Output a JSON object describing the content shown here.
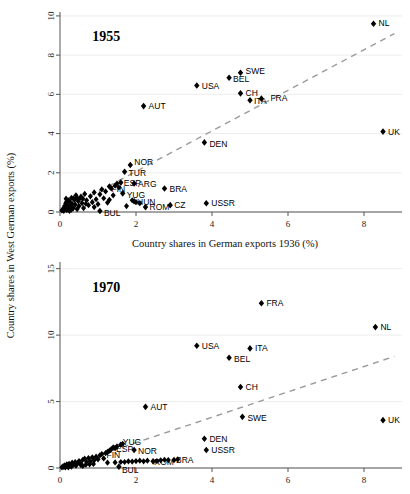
{
  "figure": {
    "xlabel": "Country shares in German exports 1936 (%)",
    "ylabel": "Country shares in West German exports (%)",
    "marker_color": "#000000",
    "refline_color": "#9a9a9a",
    "grid_color": "#e9e9e9"
  },
  "chart_data": [
    {
      "type": "scatter",
      "title": "1955",
      "xlabel": "Country shares in German exports 1936 (%)",
      "ylabel": "Country shares in West German exports (%)",
      "xlim": [
        0,
        9.0
      ],
      "ylim": [
        0,
        10.2
      ],
      "xticks": [
        0,
        2,
        4,
        6,
        8
      ],
      "yticks": [
        0,
        2,
        4,
        6,
        8,
        10
      ],
      "grid": true,
      "legend": "none",
      "annotations": [
        "1955"
      ],
      "reference_line": {
        "style": "dashed",
        "x": [
          0.0,
          8.8
        ],
        "y": [
          0.0,
          9.1
        ],
        "label": "45-degree / fitted line"
      },
      "labeled_points": [
        {
          "label": "NL",
          "x": 8.25,
          "y": 9.6
        },
        {
          "label": "SWE",
          "x": 4.75,
          "y": 7.1
        },
        {
          "label": "BEL",
          "x": 4.45,
          "y": 6.85
        },
        {
          "label": "USA",
          "x": 3.6,
          "y": 6.45
        },
        {
          "label": "CH",
          "x": 4.75,
          "y": 6.05
        },
        {
          "label": "ITA",
          "x": 5.0,
          "y": 5.7
        },
        {
          "label": "FRA",
          "x": 5.3,
          "y": 5.78
        },
        {
          "label": "AUT",
          "x": 2.2,
          "y": 5.4
        },
        {
          "label": "UK",
          "x": 8.5,
          "y": 4.1
        },
        {
          "label": "DEN",
          "x": 3.8,
          "y": 3.55
        },
        {
          "label": "NOR",
          "x": 1.85,
          "y": 2.4
        },
        {
          "label": "TUR",
          "x": 1.7,
          "y": 2.05
        },
        {
          "label": "ESP",
          "x": 1.6,
          "y": 1.5
        },
        {
          "label": "ARG",
          "x": 1.95,
          "y": 1.45
        },
        {
          "label": "FIN",
          "x": 1.3,
          "y": 1.3
        },
        {
          "label": "BRA",
          "x": 2.75,
          "y": 1.2
        },
        {
          "label": "YUG",
          "x": 1.65,
          "y": 0.95
        },
        {
          "label": "HUN",
          "x": 1.95,
          "y": 0.55
        },
        {
          "label": "ROM",
          "x": 2.25,
          "y": 0.25
        },
        {
          "label": "CZ",
          "x": 2.9,
          "y": 0.35
        },
        {
          "label": "USSR",
          "x": 3.85,
          "y": 0.45
        },
        {
          "label": "BUL",
          "x": 1.05,
          "y": 0.05
        }
      ],
      "unlabeled_points": [
        {
          "x": 0.05,
          "y": 0.08
        },
        {
          "x": 0.08,
          "y": 0.15
        },
        {
          "x": 0.1,
          "y": 0.05
        },
        {
          "x": 0.12,
          "y": 0.3
        },
        {
          "x": 0.14,
          "y": 0.22
        },
        {
          "x": 0.15,
          "y": 0.45
        },
        {
          "x": 0.18,
          "y": 0.1
        },
        {
          "x": 0.2,
          "y": 0.35
        },
        {
          "x": 0.22,
          "y": 0.6
        },
        {
          "x": 0.24,
          "y": 0.18
        },
        {
          "x": 0.26,
          "y": 0.5
        },
        {
          "x": 0.28,
          "y": 0.28
        },
        {
          "x": 0.3,
          "y": 0.72
        },
        {
          "x": 0.32,
          "y": 0.42
        },
        {
          "x": 0.35,
          "y": 0.2
        },
        {
          "x": 0.38,
          "y": 0.62
        },
        {
          "x": 0.4,
          "y": 0.38
        },
        {
          "x": 0.42,
          "y": 0.85
        },
        {
          "x": 0.45,
          "y": 0.15
        },
        {
          "x": 0.48,
          "y": 0.55
        },
        {
          "x": 0.5,
          "y": 0.3
        },
        {
          "x": 0.55,
          "y": 0.78
        },
        {
          "x": 0.58,
          "y": 0.45
        },
        {
          "x": 0.62,
          "y": 0.2
        },
        {
          "x": 0.65,
          "y": 0.92
        },
        {
          "x": 0.7,
          "y": 0.6
        },
        {
          "x": 0.75,
          "y": 0.35
        },
        {
          "x": 0.8,
          "y": 0.8
        },
        {
          "x": 0.85,
          "y": 0.5
        },
        {
          "x": 0.9,
          "y": 1.0
        },
        {
          "x": 0.95,
          "y": 0.65
        },
        {
          "x": 1.0,
          "y": 0.4
        },
        {
          "x": 1.05,
          "y": 0.9
        },
        {
          "x": 1.1,
          "y": 1.15
        },
        {
          "x": 1.15,
          "y": 0.7
        },
        {
          "x": 1.2,
          "y": 1.05
        },
        {
          "x": 1.25,
          "y": 0.48
        },
        {
          "x": 1.35,
          "y": 1.2
        },
        {
          "x": 1.4,
          "y": 0.85
        },
        {
          "x": 1.45,
          "y": 1.35
        },
        {
          "x": 1.5,
          "y": 1.45
        },
        {
          "x": 1.55,
          "y": 1.25
        },
        {
          "x": 0.6,
          "y": 0.68
        },
        {
          "x": 0.35,
          "y": 0.7
        },
        {
          "x": 0.45,
          "y": 0.72
        },
        {
          "x": 0.18,
          "y": 0.55
        },
        {
          "x": 0.9,
          "y": 0.25
        },
        {
          "x": 1.3,
          "y": 0.62
        },
        {
          "x": 1.75,
          "y": 0.3
        },
        {
          "x": 0.68,
          "y": 0.42
        },
        {
          "x": 0.25,
          "y": 0.05
        },
        {
          "x": 0.16,
          "y": 0.68
        },
        {
          "x": 0.3,
          "y": 0.12
        },
        {
          "x": 0.5,
          "y": 0.65
        },
        {
          "x": 2.0,
          "y": 0.5
        },
        {
          "x": 2.1,
          "y": 0.45
        },
        {
          "x": 1.9,
          "y": 0.6
        }
      ]
    },
    {
      "type": "scatter",
      "title": "1970",
      "xlabel": "Country shares in German exports 1936 (%)",
      "ylabel": "Country shares in West German exports (%)",
      "xlim": [
        0,
        9.0
      ],
      "ylim": [
        0,
        15.5
      ],
      "xticks": [
        0,
        2,
        4,
        6,
        8
      ],
      "yticks": [
        0,
        5,
        10,
        15
      ],
      "grid": true,
      "legend": "none",
      "annotations": [
        "1970"
      ],
      "reference_line": {
        "style": "dashed",
        "x": [
          0.0,
          8.8
        ],
        "y": [
          0.0,
          8.4
        ],
        "label": "45-degree / fitted line"
      },
      "labeled_points": [
        {
          "label": "FRA",
          "x": 5.3,
          "y": 12.4
        },
        {
          "label": "NL",
          "x": 8.3,
          "y": 10.6
        },
        {
          "label": "USA",
          "x": 3.6,
          "y": 9.2
        },
        {
          "label": "ITA",
          "x": 5.0,
          "y": 9.0
        },
        {
          "label": "BEL",
          "x": 4.45,
          "y": 8.3
        },
        {
          "label": "CH",
          "x": 4.75,
          "y": 6.1
        },
        {
          "label": "AUT",
          "x": 2.25,
          "y": 4.6
        },
        {
          "label": "SWE",
          "x": 4.8,
          "y": 3.85
        },
        {
          "label": "UK",
          "x": 8.5,
          "y": 3.6
        },
        {
          "label": "DEN",
          "x": 3.8,
          "y": 2.2
        },
        {
          "label": "USSR",
          "x": 3.85,
          "y": 1.35
        },
        {
          "label": "YUG",
          "x": 1.6,
          "y": 1.75
        },
        {
          "label": "NOR",
          "x": 1.95,
          "y": 1.35
        },
        {
          "label": "ESP",
          "x": 1.45,
          "y": 1.5
        },
        {
          "label": "FIN",
          "x": 1.25,
          "y": 1.2
        },
        {
          "label": "ROM",
          "x": 2.45,
          "y": 0.5
        },
        {
          "label": "BRA",
          "x": 3.0,
          "y": 0.6
        },
        {
          "label": "BUL",
          "x": 1.55,
          "y": 0.1
        }
      ],
      "unlabeled_points": [
        {
          "x": 0.05,
          "y": 0.05
        },
        {
          "x": 0.08,
          "y": 0.12
        },
        {
          "x": 0.1,
          "y": 0.08
        },
        {
          "x": 0.12,
          "y": 0.2
        },
        {
          "x": 0.15,
          "y": 0.1
        },
        {
          "x": 0.18,
          "y": 0.28
        },
        {
          "x": 0.2,
          "y": 0.15
        },
        {
          "x": 0.24,
          "y": 0.32
        },
        {
          "x": 0.28,
          "y": 0.2
        },
        {
          "x": 0.32,
          "y": 0.4
        },
        {
          "x": 0.36,
          "y": 0.25
        },
        {
          "x": 0.4,
          "y": 0.45
        },
        {
          "x": 0.45,
          "y": 0.3
        },
        {
          "x": 0.5,
          "y": 0.52
        },
        {
          "x": 0.55,
          "y": 0.35
        },
        {
          "x": 0.6,
          "y": 0.62
        },
        {
          "x": 0.65,
          "y": 0.7
        },
        {
          "x": 0.7,
          "y": 0.45
        },
        {
          "x": 0.75,
          "y": 0.75
        },
        {
          "x": 0.8,
          "y": 0.5
        },
        {
          "x": 0.85,
          "y": 0.8
        },
        {
          "x": 0.9,
          "y": 0.58
        },
        {
          "x": 0.95,
          "y": 0.85
        },
        {
          "x": 1.0,
          "y": 0.65
        },
        {
          "x": 1.05,
          "y": 0.95
        },
        {
          "x": 1.1,
          "y": 1.05
        },
        {
          "x": 1.15,
          "y": 0.72
        },
        {
          "x": 1.2,
          "y": 1.12
        },
        {
          "x": 1.3,
          "y": 1.3
        },
        {
          "x": 1.35,
          "y": 1.42
        },
        {
          "x": 1.4,
          "y": 1.55
        },
        {
          "x": 1.5,
          "y": 1.62
        },
        {
          "x": 1.65,
          "y": 1.82
        },
        {
          "x": 1.7,
          "y": 0.45
        },
        {
          "x": 1.8,
          "y": 0.5
        },
        {
          "x": 1.9,
          "y": 0.48
        },
        {
          "x": 2.0,
          "y": 0.52
        },
        {
          "x": 2.1,
          "y": 0.55
        },
        {
          "x": 2.2,
          "y": 0.5
        },
        {
          "x": 2.3,
          "y": 0.55
        },
        {
          "x": 2.55,
          "y": 0.52
        },
        {
          "x": 2.65,
          "y": 0.58
        },
        {
          "x": 2.75,
          "y": 0.62
        },
        {
          "x": 2.85,
          "y": 0.6
        },
        {
          "x": 3.1,
          "y": 0.65
        },
        {
          "x": 0.3,
          "y": 0.1
        },
        {
          "x": 0.42,
          "y": 0.18
        },
        {
          "x": 0.55,
          "y": 0.22
        },
        {
          "x": 0.68,
          "y": 0.25
        },
        {
          "x": 0.78,
          "y": 0.28
        },
        {
          "x": 0.88,
          "y": 0.3
        },
        {
          "x": 1.25,
          "y": 0.4
        },
        {
          "x": 1.45,
          "y": 0.42
        },
        {
          "x": 0.22,
          "y": 0.05
        },
        {
          "x": 0.14,
          "y": 0.05
        },
        {
          "x": 0.6,
          "y": 0.15
        },
        {
          "x": 1.6,
          "y": 0.45
        }
      ]
    }
  ]
}
